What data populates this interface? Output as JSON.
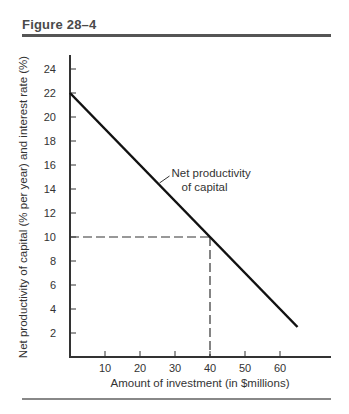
{
  "figure": {
    "title": "Figure 28–4"
  },
  "chart_data": {
    "type": "line",
    "title": "Figure 28–4",
    "xlabel": "Amount of investment (in $millions)",
    "ylabel": "Net productivity of capital (% per year) and interest rate (%)",
    "xlim": [
      0,
      75
    ],
    "ylim": [
      0,
      25
    ],
    "xticks": [
      10,
      20,
      30,
      40,
      50,
      60
    ],
    "yticks": [
      2,
      4,
      6,
      8,
      10,
      12,
      14,
      16,
      18,
      20,
      22,
      24
    ],
    "grid": false,
    "series": [
      {
        "name": "Net productivity of capital",
        "x": [
          0,
          40,
          65
        ],
        "y": [
          22,
          10,
          2.5
        ]
      }
    ],
    "annotations": [
      {
        "text": "Net productivity of capital",
        "lines": [
          "Net productivity",
          "of capital"
        ],
        "points_to": [
          25,
          14.5
        ]
      },
      {
        "type": "dashed-guide",
        "x": 40,
        "y": 10
      }
    ]
  }
}
